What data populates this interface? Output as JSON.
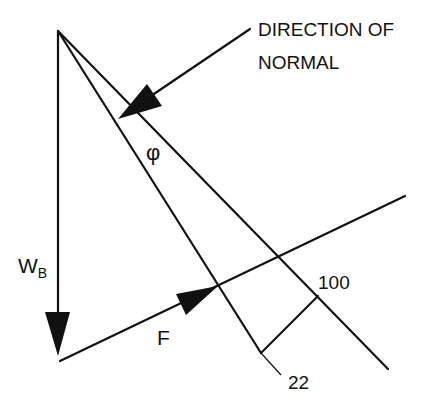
{
  "labels": {
    "normal_line1": "DIRECTION OF",
    "normal_line2": "NORMAL",
    "weight": "W",
    "weight_sub": "B",
    "phi": "φ",
    "force": "F",
    "value_100": "100",
    "value_22": "22"
  },
  "colors": {
    "stroke": "#111111",
    "background": "#ffffff"
  }
}
